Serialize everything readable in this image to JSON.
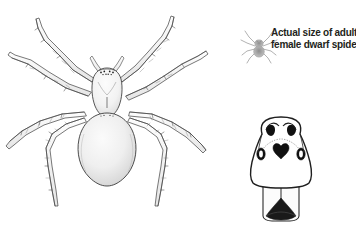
{
  "figure": {
    "kind": "scientific-line-illustration",
    "subject": "dwarf spider",
    "background_color": "#ffffff",
    "ink_color": "#231f20",
    "line_color": "#3a3a3a",
    "shade_color": "#c9c9c9",
    "actual_size_icon_color": "#9a9a9a"
  },
  "caption": {
    "line1": "Actual size of adult",
    "line2": "female dwarf spider",
    "full_text": "Actual size of adult female dwarf spider",
    "color": "#231f20"
  },
  "panels": {
    "main_spider": {
      "name": "dorsal view of dwarf spider",
      "leg_count": 8,
      "body_parts": [
        "cephalothorax",
        "abdomen",
        "pedipalps",
        "legs",
        "eyes"
      ]
    },
    "actual_size_icon": {
      "name": "actual size spider silhouette",
      "scale_note": "actual size"
    },
    "detail_drawing": {
      "name": "epigynum detail drawing",
      "features": [
        "paired dark spots",
        "lateral openings",
        "central dark marking",
        "lower plate"
      ]
    }
  }
}
